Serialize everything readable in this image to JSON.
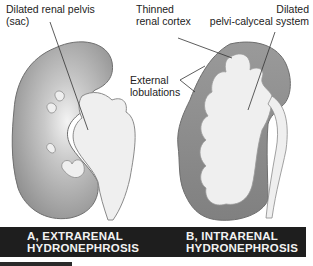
{
  "figure": {
    "panel_a": {
      "labels": {
        "pelvis_line1": "Dilated renal pelvis",
        "pelvis_line2": "(sac)"
      },
      "caption_line1": "A, EXTRARENAL",
      "caption_line2": "HYDRONEPHROSIS"
    },
    "panel_b": {
      "labels": {
        "cortex_line1": "Thinned",
        "cortex_line2": "renal cortex",
        "calyceal_line1": "Dilated",
        "calyceal_line2": "pelvi-calyceal system",
        "lobulations_line1": "External",
        "lobulations_line2": "lobulations"
      },
      "caption_line1": "B, INTRARENAL",
      "caption_line2": "HYDRONEPHROSIS"
    },
    "colors": {
      "cortex_dark": "#8a8a8a",
      "cortex_mid": "#b5b5b5",
      "pelvis_fill": "#efefef",
      "outline": "#6e6e6e",
      "caption_bg": "#1e1e1e",
      "caption_text": "#f2f2f2"
    }
  }
}
